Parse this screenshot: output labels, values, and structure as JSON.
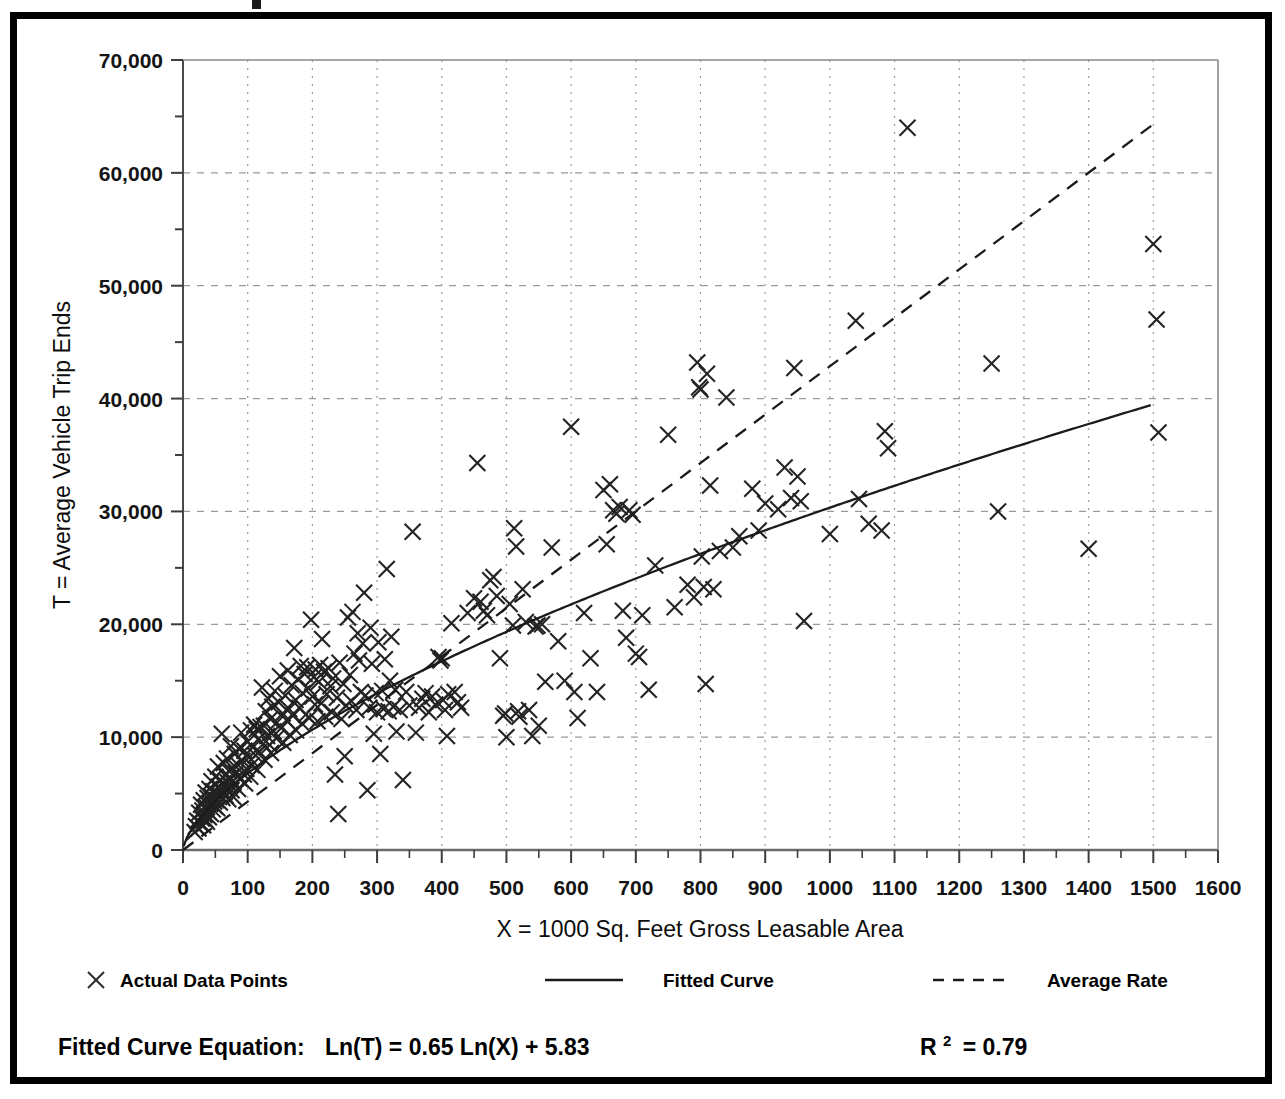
{
  "chart_data": {
    "type": "scatter",
    "title": "",
    "xlabel": "X = 1000 Sq. Feet Gross Leasable Area",
    "ylabel": "T = Average Vehicle Trip Ends",
    "xlim": [
      0,
      1600
    ],
    "ylim": [
      0,
      70000
    ],
    "xticks": [
      0,
      100,
      200,
      300,
      400,
      500,
      600,
      700,
      800,
      900,
      1000,
      1100,
      1200,
      1300,
      1400,
      1500,
      1600
    ],
    "xtick_labels": [
      "0",
      "100",
      "200",
      "300",
      "400",
      "500",
      "600",
      "700",
      "800",
      "900",
      "1000",
      "1100",
      "1200",
      "1300",
      "1400",
      "1500",
      "1600"
    ],
    "yticks": [
      0,
      10000,
      20000,
      30000,
      40000,
      50000,
      60000,
      70000
    ],
    "ytick_labels": [
      "0",
      "10,000",
      "20,000",
      "30,000",
      "40,000",
      "50,000",
      "60,000",
      "70,000"
    ],
    "y_minor_ticks": [
      5000,
      15000,
      25000,
      35000,
      45000,
      55000,
      65000
    ],
    "grid": true,
    "grid_style": "dotted",
    "grid_color": "#9a9a9a",
    "marker": "x",
    "marker_color": "#222222",
    "legend_position": "below-axis",
    "series": [
      {
        "name": "Actual Data Points",
        "type": "scatter",
        "marker": "x",
        "points": [
          [
            18,
            1600
          ],
          [
            20,
            2100
          ],
          [
            22,
            2600
          ],
          [
            24,
            1900
          ],
          [
            25,
            3300
          ],
          [
            26,
            2400
          ],
          [
            28,
            4000
          ],
          [
            29,
            2800
          ],
          [
            30,
            3500
          ],
          [
            31,
            2200
          ],
          [
            32,
            4400
          ],
          [
            33,
            3100
          ],
          [
            34,
            2700
          ],
          [
            35,
            5100
          ],
          [
            36,
            3800
          ],
          [
            37,
            2500
          ],
          [
            38,
            4600
          ],
          [
            39,
            3400
          ],
          [
            40,
            2900
          ],
          [
            41,
            5400
          ],
          [
            42,
            4100
          ],
          [
            43,
            3200
          ],
          [
            44,
            6100
          ],
          [
            45,
            4700
          ],
          [
            46,
            3600
          ],
          [
            47,
            5200
          ],
          [
            48,
            4300
          ],
          [
            49,
            3900
          ],
          [
            50,
            6500
          ],
          [
            51,
            5000
          ],
          [
            52,
            4400
          ],
          [
            53,
            3700
          ],
          [
            54,
            7400
          ],
          [
            55,
            5600
          ],
          [
            56,
            4900
          ],
          [
            57,
            4200
          ],
          [
            58,
            6200
          ],
          [
            59,
            5300
          ],
          [
            60,
            10300
          ],
          [
            61,
            4600
          ],
          [
            62,
            5900
          ],
          [
            63,
            7700
          ],
          [
            64,
            5100
          ],
          [
            65,
            6600
          ],
          [
            66,
            4800
          ],
          [
            67,
            5500
          ],
          [
            68,
            8100
          ],
          [
            69,
            6000
          ],
          [
            70,
            4500
          ],
          [
            71,
            7000
          ],
          [
            72,
            5800
          ],
          [
            73,
            6400
          ],
          [
            74,
            9200
          ],
          [
            75,
            5300
          ],
          [
            76,
            7300
          ],
          [
            77,
            6100
          ],
          [
            78,
            4700
          ],
          [
            80,
            8500
          ],
          [
            82,
            6800
          ],
          [
            84,
            7600
          ],
          [
            85,
            5400
          ],
          [
            86,
            9000
          ],
          [
            88,
            6300
          ],
          [
            90,
            10400
          ],
          [
            92,
            7900
          ],
          [
            94,
            6700
          ],
          [
            95,
            8800
          ],
          [
            96,
            5900
          ],
          [
            98,
            7200
          ],
          [
            100,
            9600
          ],
          [
            102,
            8200
          ],
          [
            104,
            6500
          ],
          [
            105,
            10600
          ],
          [
            106,
            7500
          ],
          [
            108,
            9100
          ],
          [
            110,
            11100
          ],
          [
            112,
            8400
          ],
          [
            114,
            10700
          ],
          [
            115,
            7100
          ],
          [
            116,
            9800
          ],
          [
            118,
            8700
          ],
          [
            120,
            10900
          ],
          [
            122,
            14400
          ],
          [
            124,
            9400
          ],
          [
            125,
            11000
          ],
          [
            126,
            8000
          ],
          [
            128,
            12300
          ],
          [
            130,
            10100
          ],
          [
            132,
            13400
          ],
          [
            134,
            9300
          ],
          [
            135,
            11600
          ],
          [
            136,
            8600
          ],
          [
            138,
            12700
          ],
          [
            140,
            10500
          ],
          [
            142,
            14100
          ],
          [
            144,
            9900
          ],
          [
            145,
            11300
          ],
          [
            148,
            13100
          ],
          [
            150,
            15400
          ],
          [
            152,
            10800
          ],
          [
            154,
            12100
          ],
          [
            155,
            9500
          ],
          [
            158,
            13700
          ],
          [
            160,
            11500
          ],
          [
            162,
            15900
          ],
          [
            164,
            12500
          ],
          [
            165,
            10200
          ],
          [
            168,
            14600
          ],
          [
            170,
            11900
          ],
          [
            172,
            17900
          ],
          [
            174,
            13300
          ],
          [
            175,
            10600
          ],
          [
            178,
            15100
          ],
          [
            180,
            12600
          ],
          [
            182,
            16300
          ],
          [
            184,
            11200
          ],
          [
            185,
            13900
          ],
          [
            188,
            15600
          ],
          [
            190,
            12000
          ],
          [
            192,
            16200
          ],
          [
            194,
            14300
          ],
          [
            195,
            11700
          ],
          [
            198,
            20400
          ],
          [
            200,
            13600
          ],
          [
            202,
            15300
          ],
          [
            204,
            12900
          ],
          [
            205,
            16000
          ],
          [
            208,
            11400
          ],
          [
            210,
            14900
          ],
          [
            212,
            16400
          ],
          [
            214,
            13000
          ],
          [
            215,
            18700
          ],
          [
            218,
            15800
          ],
          [
            220,
            11800
          ],
          [
            222,
            13800
          ],
          [
            225,
            16100
          ],
          [
            228,
            14500
          ],
          [
            230,
            12200
          ],
          [
            232,
            15200
          ],
          [
            235,
            6700
          ],
          [
            238,
            13500
          ],
          [
            240,
            3200
          ],
          [
            242,
            16600
          ],
          [
            245,
            11600
          ],
          [
            248,
            14700
          ],
          [
            250,
            8300
          ],
          [
            252,
            12800
          ],
          [
            255,
            20600
          ],
          [
            258,
            15500
          ],
          [
            260,
            13200
          ],
          [
            262,
            21100
          ],
          [
            265,
            17400
          ],
          [
            268,
            12400
          ],
          [
            270,
            19200
          ],
          [
            272,
            16800
          ],
          [
            275,
            14000
          ],
          [
            278,
            18300
          ],
          [
            280,
            22800
          ],
          [
            282,
            13700
          ],
          [
            285,
            5300
          ],
          [
            288,
            12600
          ],
          [
            290,
            19700
          ],
          [
            292,
            16500
          ],
          [
            295,
            10300
          ],
          [
            298,
            13900
          ],
          [
            300,
            12200
          ],
          [
            302,
            18400
          ],
          [
            305,
            8500
          ],
          [
            308,
            14100
          ],
          [
            310,
            12500
          ],
          [
            312,
            16900
          ],
          [
            315,
            24900
          ],
          [
            318,
            12300
          ],
          [
            320,
            15000
          ],
          [
            322,
            18900
          ],
          [
            325,
            12700
          ],
          [
            328,
            14200
          ],
          [
            330,
            10500
          ],
          [
            335,
            12400
          ],
          [
            340,
            6200
          ],
          [
            345,
            14000
          ],
          [
            350,
            12800
          ],
          [
            355,
            28200
          ],
          [
            360,
            10400
          ],
          [
            365,
            12600
          ],
          [
            370,
            13400
          ],
          [
            375,
            13900
          ],
          [
            380,
            12200
          ],
          [
            385,
            13600
          ],
          [
            390,
            12900
          ],
          [
            395,
            17100
          ],
          [
            398,
            16800
          ],
          [
            400,
            17000
          ],
          [
            402,
            13300
          ],
          [
            405,
            12400
          ],
          [
            408,
            10100
          ],
          [
            410,
            13800
          ],
          [
            415,
            20100
          ],
          [
            420,
            14000
          ],
          [
            425,
            13100
          ],
          [
            430,
            12600
          ],
          [
            440,
            21000
          ],
          [
            450,
            22300
          ],
          [
            455,
            34300
          ],
          [
            460,
            22000
          ],
          [
            465,
            21200
          ],
          [
            470,
            20800
          ],
          [
            475,
            23900
          ],
          [
            480,
            24200
          ],
          [
            485,
            22500
          ],
          [
            490,
            17000
          ],
          [
            495,
            11900
          ],
          [
            498,
            12100
          ],
          [
            500,
            10000
          ],
          [
            505,
            21800
          ],
          [
            510,
            19900
          ],
          [
            512,
            28500
          ],
          [
            515,
            26900
          ],
          [
            518,
            12300
          ],
          [
            520,
            11800
          ],
          [
            525,
            23100
          ],
          [
            530,
            20200
          ],
          [
            535,
            12400
          ],
          [
            540,
            10100
          ],
          [
            545,
            19800
          ],
          [
            548,
            19900
          ],
          [
            550,
            11000
          ],
          [
            555,
            20000
          ],
          [
            560,
            14900
          ],
          [
            570,
            26800
          ],
          [
            580,
            18500
          ],
          [
            590,
            15000
          ],
          [
            600,
            37500
          ],
          [
            605,
            14000
          ],
          [
            610,
            11700
          ],
          [
            620,
            21000
          ],
          [
            630,
            17000
          ],
          [
            640,
            14000
          ],
          [
            650,
            31900
          ],
          [
            655,
            27100
          ],
          [
            660,
            32400
          ],
          [
            665,
            30100
          ],
          [
            670,
            29800
          ],
          [
            675,
            30400
          ],
          [
            680,
            21200
          ],
          [
            685,
            18800
          ],
          [
            690,
            30100
          ],
          [
            695,
            29700
          ],
          [
            700,
            17400
          ],
          [
            705,
            17100
          ],
          [
            710,
            20800
          ],
          [
            720,
            14200
          ],
          [
            730,
            25200
          ],
          [
            750,
            36800
          ],
          [
            760,
            21500
          ],
          [
            780,
            23500
          ],
          [
            790,
            22400
          ],
          [
            795,
            43200
          ],
          [
            798,
            41000
          ],
          [
            800,
            40800
          ],
          [
            802,
            26000
          ],
          [
            805,
            23300
          ],
          [
            808,
            14700
          ],
          [
            810,
            42200
          ],
          [
            815,
            32300
          ],
          [
            820,
            23100
          ],
          [
            830,
            26500
          ],
          [
            840,
            40100
          ],
          [
            850,
            26800
          ],
          [
            860,
            27800
          ],
          [
            880,
            32000
          ],
          [
            890,
            28300
          ],
          [
            900,
            30700
          ],
          [
            920,
            30200
          ],
          [
            930,
            33900
          ],
          [
            940,
            31200
          ],
          [
            945,
            42700
          ],
          [
            950,
            33100
          ],
          [
            955,
            30900
          ],
          [
            960,
            20300
          ],
          [
            1000,
            28000
          ],
          [
            1040,
            46900
          ],
          [
            1045,
            31100
          ],
          [
            1060,
            28900
          ],
          [
            1080,
            28300
          ],
          [
            1085,
            37100
          ],
          [
            1090,
            35600
          ],
          [
            1120,
            64000
          ],
          [
            1250,
            43100
          ],
          [
            1260,
            30000
          ],
          [
            1400,
            26700
          ],
          [
            1500,
            53700
          ],
          [
            1505,
            47000
          ],
          [
            1508,
            37000
          ]
        ]
      },
      {
        "name": "Fitted Curve",
        "type": "line",
        "style": "solid",
        "equation": "Ln(T) = 0.65 Ln(X) + 5.83",
        "r_squared": 0.79
      },
      {
        "name": "Average Rate",
        "type": "line",
        "style": "dashed",
        "endpoints": [
          [
            0,
            0
          ],
          [
            1500,
            64300
          ]
        ]
      }
    ]
  },
  "legend": {
    "items": [
      {
        "label": "Actual Data Points",
        "marker": "x-marker"
      },
      {
        "label": "Fitted Curve",
        "marker": "solid-line"
      },
      {
        "label": "Average Rate",
        "marker": "dashed-line"
      }
    ]
  },
  "footer": {
    "equation_label": "Fitted Curve Equation:",
    "equation": "Ln(T) = 0.65 Ln(X) + 5.83",
    "r_label": "R",
    "r_exponent": "2",
    "r_value": "= 0.79"
  }
}
